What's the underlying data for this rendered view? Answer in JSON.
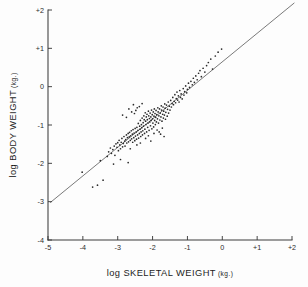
{
  "figure": {
    "background_color": "#fdfdfd",
    "ink_color": "#2a2a2a",
    "line_color": "#7a7a7a"
  },
  "chart_data": {
    "type": "scatter",
    "title": "",
    "subtitle": "",
    "xlabel": "log SKELETAL  WEIGHT",
    "xlabel_unit": "(kg.)",
    "ylabel": "log BODY WEIGHT",
    "ylabel_unit": "(kg.)",
    "xlim": [
      -5,
      2
    ],
    "ylim": [
      -4,
      2
    ],
    "xticks": [
      -5,
      -4,
      -3,
      -2,
      -1,
      0,
      1,
      2
    ],
    "xticklabels": [
      "-5",
      "-4",
      "-3",
      "-2",
      "-1",
      "0",
      "+1",
      "+2"
    ],
    "yticks": [
      -4,
      -3,
      -2,
      -1,
      0,
      1,
      2
    ],
    "yticklabels": [
      "-4",
      "-3",
      "-2",
      "-1",
      "0",
      "+1",
      "+2"
    ],
    "grid": false,
    "legend": null,
    "annotations": [],
    "reference_line": {
      "name": "isometric-regression-line",
      "type": "line",
      "x": [
        -4.93,
        2.06
      ],
      "y": [
        -3.02,
        2.18
      ],
      "slope": 0.7439,
      "intercept": 0.6455,
      "style": "solid"
    },
    "series": [
      {
        "name": "mammal-specimens",
        "marker": "dot",
        "n_points": 196,
        "points": [
          [
            -4.02,
            -2.23
          ],
          [
            -3.72,
            -2.62
          ],
          [
            -3.58,
            -2.57
          ],
          [
            -3.5,
            -1.93
          ],
          [
            -3.42,
            -2.44
          ],
          [
            -3.3,
            -1.82
          ],
          [
            -3.26,
            -1.7
          ],
          [
            -3.21,
            -1.6
          ],
          [
            -3.18,
            -1.74
          ],
          [
            -3.14,
            -1.64
          ],
          [
            -3.1,
            -1.55
          ],
          [
            -3.08,
            -1.79
          ],
          [
            -3.05,
            -1.49
          ],
          [
            -3.02,
            -1.58
          ],
          [
            -3.0,
            -1.46
          ],
          [
            -2.98,
            -1.67
          ],
          [
            -2.96,
            -1.4
          ],
          [
            -2.94,
            -1.52
          ],
          [
            -2.92,
            -1.62
          ],
          [
            -2.9,
            -1.45
          ],
          [
            -2.88,
            -1.35
          ],
          [
            -2.86,
            -1.57
          ],
          [
            -2.84,
            -1.48
          ],
          [
            -2.82,
            -1.3
          ],
          [
            -2.8,
            -1.42
          ],
          [
            -2.79,
            -1.55
          ],
          [
            -2.77,
            -1.38
          ],
          [
            -2.75,
            -1.26
          ],
          [
            -2.74,
            -1.47
          ],
          [
            -2.72,
            -1.33
          ],
          [
            -2.7,
            -1.22
          ],
          [
            -2.69,
            -1.44
          ],
          [
            -2.67,
            -1.31
          ],
          [
            -2.66,
            -1.19
          ],
          [
            -2.64,
            -1.4
          ],
          [
            -2.63,
            -1.28
          ],
          [
            -2.61,
            -1.15
          ],
          [
            -2.6,
            -1.36
          ],
          [
            -2.58,
            -1.24
          ],
          [
            -2.57,
            -1.45
          ],
          [
            -2.56,
            -1.12
          ],
          [
            -2.54,
            -1.33
          ],
          [
            -2.53,
            -1.21
          ],
          [
            -2.51,
            -1.41
          ],
          [
            -2.5,
            -1.09
          ],
          [
            -2.49,
            -1.29
          ],
          [
            -2.47,
            -1.18
          ],
          [
            -2.46,
            -1.37
          ],
          [
            -2.45,
            -1.06
          ],
          [
            -2.43,
            -1.26
          ],
          [
            -2.42,
            -1.14
          ],
          [
            -2.41,
            -0.96
          ],
          [
            -2.4,
            -1.34
          ],
          [
            -2.38,
            -1.22
          ],
          [
            -2.37,
            -1.03
          ],
          [
            -2.36,
            -1.11
          ],
          [
            -2.35,
            -0.88
          ],
          [
            -2.34,
            -1.3
          ],
          [
            -2.33,
            -1.18
          ],
          [
            -2.32,
            -0.99
          ],
          [
            -2.31,
            -1.07
          ],
          [
            -2.3,
            -0.82
          ],
          [
            -2.29,
            -1.26
          ],
          [
            -2.28,
            -1.15
          ],
          [
            -2.27,
            -0.94
          ],
          [
            -2.26,
            -1.03
          ],
          [
            -2.25,
            -0.76
          ],
          [
            -2.24,
            -0.86
          ],
          [
            -2.23,
            -1.22
          ],
          [
            -2.22,
            -1.11
          ],
          [
            -2.21,
            -0.68
          ],
          [
            -2.2,
            -0.9
          ],
          [
            -2.19,
            -0.99
          ],
          [
            -2.18,
            -0.79
          ],
          [
            -2.17,
            -1.18
          ],
          [
            -2.16,
            -0.72
          ],
          [
            -2.15,
            -0.86
          ],
          [
            -2.14,
            -1.06
          ],
          [
            -2.13,
            -0.95
          ],
          [
            -2.12,
            -0.64
          ],
          [
            -2.11,
            -0.76
          ],
          [
            -2.1,
            -1.14
          ],
          [
            -2.09,
            -0.83
          ],
          [
            -2.08,
            -0.92
          ],
          [
            -2.07,
            -0.69
          ],
          [
            -2.06,
            -1.02
          ],
          [
            -2.05,
            -0.79
          ],
          [
            -2.04,
            -0.88
          ],
          [
            -2.03,
            -0.61
          ],
          [
            -2.02,
            -1.1
          ],
          [
            -2.01,
            -0.73
          ],
          [
            -2.0,
            -0.84
          ],
          [
            -1.99,
            -0.95
          ],
          [
            -1.98,
            -0.66
          ],
          [
            -1.97,
            -1.05
          ],
          [
            -1.96,
            -0.77
          ],
          [
            -1.95,
            -0.58
          ],
          [
            -1.94,
            -0.88
          ],
          [
            -1.93,
            -0.7
          ],
          [
            -1.92,
            -0.99
          ],
          [
            -1.91,
            -0.8
          ],
          [
            -1.9,
            -0.62
          ],
          [
            -1.89,
            -0.92
          ],
          [
            -1.88,
            -0.73
          ],
          [
            -1.87,
            -1.13
          ],
          [
            -1.86,
            -0.84
          ],
          [
            -1.85,
            -0.55
          ],
          [
            -1.84,
            -0.66
          ],
          [
            -1.83,
            -0.95
          ],
          [
            -1.82,
            -0.76
          ],
          [
            -1.81,
            -1.18
          ],
          [
            -1.8,
            -0.58
          ],
          [
            -1.79,
            -0.87
          ],
          [
            -1.78,
            -0.69
          ],
          [
            -1.77,
            -1.24
          ],
          [
            -1.76,
            -0.79
          ],
          [
            -1.75,
            -0.5
          ],
          [
            -1.74,
            -0.61
          ],
          [
            -1.73,
            -0.9
          ],
          [
            -1.72,
            -1.08
          ],
          [
            -1.71,
            -0.72
          ],
          [
            -1.7,
            -0.53
          ],
          [
            -1.69,
            -0.82
          ],
          [
            -1.68,
            -0.64
          ],
          [
            -1.67,
            -1.3
          ],
          [
            -1.66,
            -0.74
          ],
          [
            -1.65,
            -0.45
          ],
          [
            -1.64,
            -0.56
          ],
          [
            -1.63,
            -0.85
          ],
          [
            -1.62,
            -0.67
          ],
          [
            -1.6,
            -0.48
          ],
          [
            -1.58,
            -0.77
          ],
          [
            -1.57,
            -0.59
          ],
          [
            -1.55,
            -0.4
          ],
          [
            -1.54,
            -0.69
          ],
          [
            -1.52,
            -0.51
          ],
          [
            -1.5,
            -0.61
          ],
          [
            -1.48,
            -0.36
          ],
          [
            -1.46,
            -0.53
          ],
          [
            -1.44,
            -0.44
          ],
          [
            -1.42,
            -0.28
          ],
          [
            -1.4,
            -0.47
          ],
          [
            -1.38,
            -0.38
          ],
          [
            -1.36,
            -0.21
          ],
          [
            -1.34,
            -0.42
          ],
          [
            -1.32,
            -0.31
          ],
          [
            -1.3,
            -0.14
          ],
          [
            -1.28,
            -0.35
          ],
          [
            -1.26,
            -0.24
          ],
          [
            -1.24,
            -0.4
          ],
          [
            -1.22,
            -0.1
          ],
          [
            -1.2,
            -0.28
          ],
          [
            -1.18,
            -0.19
          ],
          [
            -1.15,
            -0.32
          ],
          [
            -1.12,
            -0.05
          ],
          [
            -1.1,
            -0.22
          ],
          [
            -1.08,
            -0.13
          ],
          [
            -1.05,
            0.02
          ],
          [
            -1.02,
            -0.16
          ],
          [
            -1.0,
            -0.07
          ],
          [
            -0.97,
            0.09
          ],
          [
            -0.94,
            -0.02
          ],
          [
            -0.9,
            0.14
          ],
          [
            -0.86,
            0.05
          ],
          [
            -0.83,
            0.22
          ],
          [
            -0.8,
            0.11
          ],
          [
            -0.76,
            0.28
          ],
          [
            -0.72,
            0.18
          ],
          [
            -0.68,
            0.35
          ],
          [
            -0.64,
            0.42
          ],
          [
            -0.6,
            0.26
          ],
          [
            -0.55,
            0.48
          ],
          [
            -0.5,
            0.38
          ],
          [
            -0.45,
            0.55
          ],
          [
            -0.4,
            0.63
          ],
          [
            -0.33,
            0.72
          ],
          [
            -0.28,
            0.46
          ],
          [
            -0.2,
            0.8
          ],
          [
            -0.12,
            0.9
          ],
          [
            -0.02,
            0.98
          ],
          [
            -2.48,
            -0.62
          ],
          [
            -2.52,
            -0.7
          ],
          [
            -2.44,
            -0.55
          ],
          [
            -2.6,
            -0.66
          ],
          [
            -2.68,
            -0.58
          ],
          [
            -2.75,
            -0.8
          ],
          [
            -2.86,
            -0.74
          ],
          [
            -2.55,
            -0.47
          ],
          [
            -2.38,
            -0.52
          ],
          [
            -2.3,
            -0.44
          ],
          [
            -2.2,
            -1.35
          ],
          [
            -2.12,
            -1.28
          ],
          [
            -2.05,
            -1.42
          ],
          [
            -1.96,
            -1.22
          ],
          [
            -2.35,
            -1.47
          ],
          [
            -2.45,
            -1.52
          ],
          [
            -2.64,
            -1.62
          ],
          [
            -2.92,
            -1.9
          ],
          [
            -3.12,
            -2.02
          ],
          [
            -2.7,
            -1.98
          ]
        ]
      }
    ]
  },
  "axes": {
    "x_axis_name": "x-axis",
    "y_axis_name": "y-axis"
  }
}
